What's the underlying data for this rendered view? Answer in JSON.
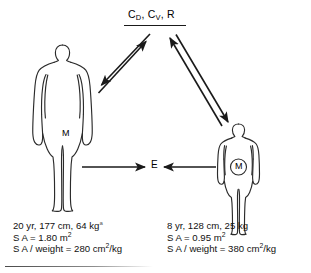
{
  "diagram": {
    "type": "flow-diagram",
    "title_present": false,
    "nodes": {
      "media": {
        "label_full": "CD, CV, R",
        "part_c": "C",
        "sub_d": "D",
        "sep1": ", C",
        "sub_v": "V",
        "sep2": ", R",
        "meaning": "dermal concentration, vapor concentration, respiration"
      },
      "exposure": {
        "label": "E"
      },
      "adult_body": {
        "label": "M",
        "circled": false
      },
      "child_body": {
        "label": "M",
        "circled": true
      }
    },
    "captions": {
      "adult": {
        "line1_text": "20 yr, 177 cm, 64 kg",
        "line1_mark": "a",
        "line2_prefix": "S A = 1.80 m",
        "line2_sup": "2",
        "line3_prefix": "S A / weight = 280 cm",
        "line3_sup": "2",
        "line3_suffix": "/kg"
      },
      "child": {
        "line1_text": "8 yr, 128 cm, 25 kg",
        "line2_prefix": "S A = 0.95 m",
        "line2_sup": "2",
        "line3_prefix": "S A / weight = 380 cm",
        "line3_sup": "2",
        "line3_suffix": "/kg"
      }
    },
    "arrows": [
      {
        "name": "adult-to-media",
        "from": "adult_body",
        "to": "media",
        "direction": "up-right"
      },
      {
        "name": "media-to-adult",
        "from": "media",
        "to": "adult_body",
        "direction": "down-left"
      },
      {
        "name": "child-to-media",
        "from": "child_body",
        "to": "media",
        "direction": "up-left"
      },
      {
        "name": "media-to-child",
        "from": "media",
        "to": "child_body",
        "direction": "down-right"
      },
      {
        "name": "adult-to-exposure",
        "from": "adult_body",
        "to": "exposure",
        "direction": "right"
      },
      {
        "name": "child-to-exposure",
        "from": "child_body",
        "to": "exposure",
        "direction": "left"
      }
    ],
    "colors": {
      "stroke": "#1a1a1a",
      "body_outline": "#2b2b2b",
      "text": "#101010",
      "background": "#ffffff"
    }
  }
}
